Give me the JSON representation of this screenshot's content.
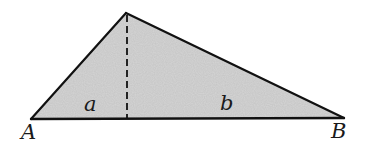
{
  "diagram": {
    "type": "triangle-with-altitude",
    "colors": {
      "fill": "#d6d6d6",
      "stroke": "#111111",
      "background": "#ffffff"
    },
    "vertices": {
      "A": {
        "label": "A",
        "x": 31,
        "y": 119
      },
      "B": {
        "label": "B",
        "x": 344,
        "y": 118
      },
      "apex": {
        "label": "",
        "x": 126,
        "y": 13
      }
    },
    "altitude": {
      "x": 127,
      "y_top": 13,
      "y_bottom": 118,
      "style": "dashed"
    },
    "segments": [
      {
        "label": "a",
        "description": "base segment from A to foot of altitude"
      },
      {
        "label": "b",
        "description": "base segment from foot of altitude to B"
      }
    ],
    "labels": {
      "A": "A",
      "B": "B",
      "a": "a",
      "b": "b"
    }
  }
}
